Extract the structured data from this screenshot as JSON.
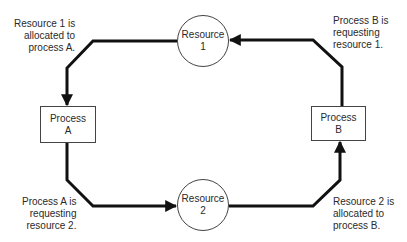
{
  "nodes": {
    "resource1": {
      "line1": "Resource",
      "line2": "1"
    },
    "resource2": {
      "line1": "Resource",
      "line2": "2"
    },
    "processA": {
      "line1": "Process",
      "line2": "A"
    },
    "processB": {
      "line1": "Process",
      "line2": "B"
    }
  },
  "annotations": {
    "top_left": [
      "Resource 1 is",
      "allocated to",
      "process A."
    ],
    "top_right": [
      "Process B is",
      "requesting",
      "resource 1."
    ],
    "bottom_left": [
      "Process A is",
      "requesting",
      "resource 2."
    ],
    "bottom_right": [
      "Resource 2 is",
      "allocated to",
      "process B."
    ]
  },
  "edges": [
    {
      "from": "Resource 1",
      "to": "Process A",
      "meaning": "allocated"
    },
    {
      "from": "Process A",
      "to": "Resource 2",
      "meaning": "requesting"
    },
    {
      "from": "Resource 2",
      "to": "Process B",
      "meaning": "allocated"
    },
    {
      "from": "Process B",
      "to": "Resource 1",
      "meaning": "requesting"
    }
  ],
  "colors": {
    "line": "#111111",
    "border": "#444444",
    "text": "#2a2a2a"
  }
}
